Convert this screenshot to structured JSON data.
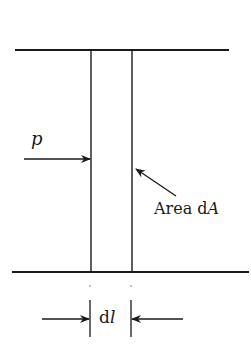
{
  "diagram": {
    "labels": {
      "pressure": "p",
      "area_prefix": "Area d",
      "area_var": "A",
      "length_prefix": "d",
      "length_var": "l"
    },
    "colors": {
      "line": "#1a1a1a",
      "background": "#ffffff"
    }
  }
}
